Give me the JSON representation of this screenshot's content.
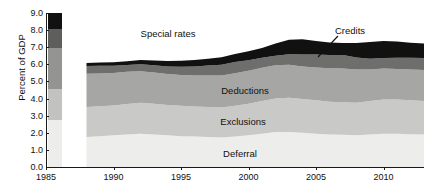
{
  "chart_data": {
    "type": "area",
    "stacked": true,
    "title": "",
    "subtitle": "",
    "xlabel": "",
    "ylabel": "Percent of GDP",
    "xlim": [
      1985,
      2013
    ],
    "ylim": [
      0.0,
      9.0
    ],
    "grid": false,
    "legend_position": "in-plot band labels",
    "x_tick_labels": [
      "1985",
      "1990",
      "1995",
      "2000",
      "2005",
      "2010"
    ],
    "x_ticks": [
      1985,
      1990,
      1995,
      2000,
      2005,
      2010
    ],
    "y_tick_labels": [
      "0.0",
      "1.0",
      "2.0",
      "3.0",
      "4.0",
      "5.0",
      "6.0",
      "7.0",
      "8.0",
      "9.0"
    ],
    "y_ticks": [
      0.0,
      1.0,
      2.0,
      3.0,
      4.0,
      5.0,
      6.0,
      7.0,
      8.0,
      9.0
    ],
    "data_start_year": 1988,
    "data_end_year": 2013,
    "x": [
      1988,
      1989,
      1990,
      1991,
      1992,
      1993,
      1994,
      1995,
      1996,
      1997,
      1998,
      1999,
      2000,
      2001,
      2002,
      2003,
      2004,
      2005,
      2006,
      2007,
      2008,
      2009,
      2010,
      2011,
      2012,
      2013
    ],
    "series": [
      {
        "name": "Deferral",
        "color": "#ededeb",
        "values": [
          1.75,
          1.8,
          1.85,
          1.9,
          1.95,
          1.9,
          1.85,
          1.8,
          1.78,
          1.75,
          1.72,
          1.78,
          1.85,
          1.95,
          2.05,
          2.05,
          2.0,
          1.95,
          1.9,
          1.88,
          1.85,
          1.9,
          1.95,
          1.95,
          1.92,
          1.9
        ]
      },
      {
        "name": "Exclusions",
        "color": "#c9c9c7",
        "values": [
          1.75,
          1.75,
          1.75,
          1.78,
          1.8,
          1.8,
          1.78,
          1.78,
          1.75,
          1.75,
          1.75,
          1.8,
          1.85,
          1.9,
          1.95,
          2.0,
          1.98,
          1.95,
          1.92,
          1.9,
          1.9,
          1.95,
          2.0,
          2.0,
          1.98,
          1.95
        ]
      },
      {
        "name": "Deductions",
        "color": "#a6a6a4",
        "values": [
          1.95,
          1.92,
          1.9,
          1.88,
          1.85,
          1.82,
          1.8,
          1.8,
          1.82,
          1.85,
          1.88,
          1.9,
          1.92,
          1.95,
          1.95,
          1.92,
          1.9,
          1.92,
          1.95,
          1.98,
          1.95,
          1.85,
          1.8,
          1.78,
          1.8,
          1.82
        ]
      },
      {
        "name": "Special rates",
        "color": "#6e6e6c",
        "values": [
          0.45,
          0.45,
          0.42,
          0.4,
          0.4,
          0.42,
          0.45,
          0.48,
          0.52,
          0.58,
          0.62,
          0.65,
          0.62,
          0.58,
          0.55,
          0.62,
          0.7,
          0.75,
          0.78,
          0.78,
          0.7,
          0.62,
          0.62,
          0.65,
          0.68,
          0.7
        ]
      },
      {
        "name": "Credits",
        "color": "#111111",
        "values": [
          0.18,
          0.18,
          0.2,
          0.22,
          0.25,
          0.28,
          0.32,
          0.35,
          0.38,
          0.4,
          0.45,
          0.48,
          0.52,
          0.58,
          0.72,
          0.85,
          0.88,
          0.8,
          0.72,
          0.7,
          0.85,
          0.98,
          1.0,
          0.95,
          0.88,
          0.85
        ]
      }
    ],
    "annotations": [
      {
        "text": "Special rates",
        "type": "outside-label"
      },
      {
        "text": "Credits",
        "type": "leader-line-label"
      },
      {
        "text": "Deductions",
        "type": "in-band-label"
      },
      {
        "text": "Exclusions",
        "type": "in-band-label"
      },
      {
        "text": "Deferral",
        "type": "in-band-label"
      }
    ]
  },
  "axes": {
    "y_title": "Percent of GDP",
    "y_ticks": [
      {
        "label": "9.0",
        "value": 9.0
      },
      {
        "label": "8.0",
        "value": 8.0
      },
      {
        "label": "7.0",
        "value": 7.0
      },
      {
        "label": "6.0",
        "value": 6.0
      },
      {
        "label": "5.0",
        "value": 5.0
      },
      {
        "label": "4.0",
        "value": 4.0
      },
      {
        "label": "3.0",
        "value": 3.0
      },
      {
        "label": "2.0",
        "value": 2.0
      },
      {
        "label": "1.0",
        "value": 1.0
      },
      {
        "label": "0.0",
        "value": 0.0
      }
    ],
    "x_ticks": [
      {
        "label": "1985",
        "value": 1985
      },
      {
        "label": "1990",
        "value": 1990
      },
      {
        "label": "1995",
        "value": 1995
      },
      {
        "label": "2000",
        "value": 2000
      },
      {
        "label": "2005",
        "value": 2005
      },
      {
        "label": "2010",
        "value": 2010
      }
    ]
  },
  "legend_strip": {
    "description": "vertical color ramp sample at left edge of plot",
    "bands": [
      {
        "name": "Credits",
        "color": "#111111",
        "from": 8.05,
        "to": 9.0
      },
      {
        "name": "Special rates",
        "color": "#5e5e5c",
        "from": 6.95,
        "to": 8.05
      },
      {
        "name": "Deductions",
        "color": "#949492",
        "from": 4.55,
        "to": 6.95
      },
      {
        "name": "Exclusions",
        "color": "#c2c2c0",
        "from": 2.75,
        "to": 4.55
      },
      {
        "name": "Deferral",
        "color": "#ededeb",
        "from": 0.0,
        "to": 2.75
      }
    ]
  },
  "labels": {
    "special_rates": "Special rates",
    "credits": "Credits",
    "deductions": "Deductions",
    "exclusions": "Exclusions",
    "deferral": "Deferral"
  },
  "colors": {
    "deferral": "#ededeb",
    "exclusions": "#c9c9c7",
    "deductions": "#a6a6a4",
    "special_rates": "#6e6e6c",
    "credits": "#111111",
    "axis": "#1a1a1a",
    "text": "#111111",
    "background": "#ffffff"
  }
}
